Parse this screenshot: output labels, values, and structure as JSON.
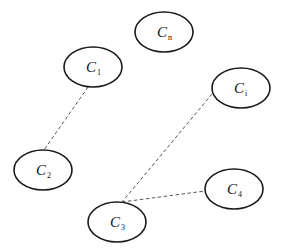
{
  "diagram": {
    "type": "cluster-graph",
    "nodes": [
      {
        "id": "Cn",
        "label": "C",
        "subscript": "n",
        "cx": 164,
        "cy": 32,
        "rx": 29,
        "ry": 20
      },
      {
        "id": "C1",
        "label": "C",
        "subscript": "1",
        "cx": 93,
        "cy": 67,
        "rx": 29,
        "ry": 20
      },
      {
        "id": "Ci",
        "label": "C",
        "subscript": "i",
        "cx": 241,
        "cy": 88,
        "rx": 29,
        "ry": 20
      },
      {
        "id": "C2",
        "label": "C",
        "subscript": "2",
        "cx": 43,
        "cy": 170,
        "rx": 29,
        "ry": 20
      },
      {
        "id": "C4",
        "label": "C",
        "subscript": "4",
        "cx": 234,
        "cy": 189,
        "rx": 29,
        "ry": 20
      },
      {
        "id": "C3",
        "label": "C",
        "subscript": "3",
        "cx": 117,
        "cy": 222,
        "rx": 29,
        "ry": 20
      }
    ],
    "edges": [
      {
        "from": "C1",
        "to": "C2",
        "style": "dashed",
        "x1": 88,
        "y1": 87,
        "x2": 44,
        "y2": 150
      },
      {
        "from": "Ci",
        "to": "C3",
        "style": "dashed",
        "x1": 212,
        "y1": 94,
        "x2": 122,
        "y2": 202
      },
      {
        "from": "C3",
        "to": "C4",
        "style": "dashed",
        "x1": 122,
        "y1": 202,
        "x2": 205,
        "y2": 191
      }
    ]
  }
}
